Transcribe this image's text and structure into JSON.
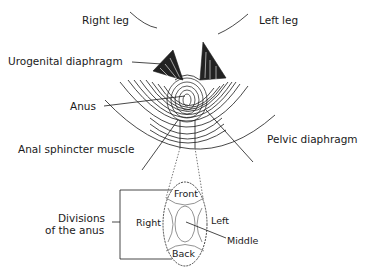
{
  "diagram": {
    "type": "anatomical-illustration",
    "labels": {
      "right_leg": "Right leg",
      "left_leg": "Left leg",
      "urogenital_diaphragm": "Urogenital diaphragm",
      "anus": "Anus",
      "anal_sphincter_muscle": "Anal sphincter muscle",
      "pelvic_diaphragm": "Pelvic diaphragm",
      "divisions_line1": "Divisions",
      "divisions_line2": "of the anus"
    },
    "divisions": {
      "front": "Front",
      "back": "Back",
      "right": "Right",
      "left": "Left",
      "middle": "Middle"
    },
    "colors": {
      "ink": "#1a1a1a",
      "background": "#ffffff",
      "dotted": "#555555"
    }
  }
}
